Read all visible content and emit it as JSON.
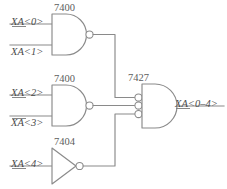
{
  "diagram": {
    "line_color": "#8a8a8a",
    "text_color": "#4a4a4a",
    "background": "#ffffff"
  },
  "gates": [
    {
      "id": "nand1",
      "chip": "7400",
      "type": "nand",
      "inputs": [
        "XA<0>",
        "XA<1>"
      ]
    },
    {
      "id": "nand2",
      "chip": "7400",
      "type": "nand",
      "inputs": [
        "XA<2>",
        "XA<3>"
      ]
    },
    {
      "id": "inv1",
      "chip": "7404",
      "type": "inverter",
      "inputs": [
        "XA<4>"
      ]
    },
    {
      "id": "nor1",
      "chip": "7427",
      "type": "nor3",
      "inputs": [],
      "output": "XA<0–4>"
    }
  ],
  "labels": {
    "nand1_chip": "7400",
    "nand1_in0": "XA<0>",
    "nand1_in1": "XA<1>",
    "nand2_chip": "7400",
    "nand2_in0": "XA<2>",
    "nand2_in1": "XA<3>",
    "inv_chip": "7404",
    "inv_in0": "XA<4>",
    "nor_chip": "7427",
    "output": "XA<0–4>"
  }
}
